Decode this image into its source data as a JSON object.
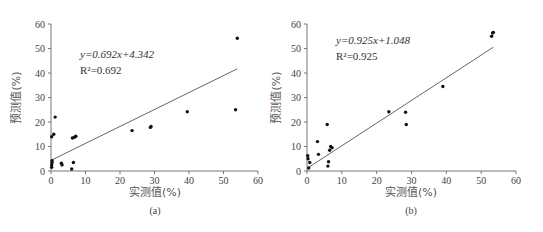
{
  "chart_data": [
    {
      "type": "scatter",
      "panel": "(a)",
      "xlabel": "实测值(%)",
      "ylabel": "预测值(%)",
      "xlim": [
        0,
        60
      ],
      "ylim": [
        0,
        60
      ],
      "xticks": [
        0,
        10,
        20,
        30,
        40,
        50,
        60
      ],
      "yticks": [
        0,
        10,
        20,
        30,
        40,
        50,
        60
      ],
      "grid": false,
      "equation": "y=0.692x+4.342",
      "r2": "R²=0.692",
      "fit": {
        "slope": 0.692,
        "intercept": 4.342,
        "x_range": [
          0,
          54
        ]
      },
      "points": [
        [
          0.2,
          1.5
        ],
        [
          0.2,
          2.5
        ],
        [
          0.3,
          4.2
        ],
        [
          0.3,
          3.5
        ],
        [
          0.2,
          14
        ],
        [
          0.8,
          15
        ],
        [
          1.2,
          22
        ],
        [
          3,
          3.2
        ],
        [
          3.2,
          2.5
        ],
        [
          6,
          0.8
        ],
        [
          6.5,
          3.5
        ],
        [
          6.2,
          13.5
        ],
        [
          6.8,
          13.8
        ],
        [
          7.2,
          14.2
        ],
        [
          23.5,
          16.5
        ],
        [
          28.8,
          17.8
        ],
        [
          29,
          18.2
        ],
        [
          39.5,
          24.2
        ],
        [
          53.5,
          25
        ],
        [
          54,
          54.2
        ]
      ]
    },
    {
      "type": "scatter",
      "panel": "(b)",
      "xlabel": "实测值(%)",
      "ylabel": "预测值(%)",
      "xlim": [
        0,
        60
      ],
      "ylim": [
        0,
        60
      ],
      "xticks": [
        0,
        10,
        20,
        30,
        40,
        50,
        60
      ],
      "yticks": [
        0,
        10,
        20,
        30,
        40,
        50,
        60
      ],
      "grid": false,
      "equation": "y=0.925x+1.048",
      "r2": "R²=0.925",
      "fit": {
        "slope": 0.925,
        "intercept": 1.048,
        "x_range": [
          0,
          53.5
        ]
      },
      "points": [
        [
          0.2,
          6.2
        ],
        [
          0.3,
          5
        ],
        [
          0.5,
          1.2
        ],
        [
          0.8,
          3.5
        ],
        [
          3,
          12
        ],
        [
          3.3,
          6.8
        ],
        [
          5.8,
          19
        ],
        [
          6,
          2
        ],
        [
          6.2,
          3.8
        ],
        [
          6.5,
          8.5
        ],
        [
          6.8,
          10
        ],
        [
          7.2,
          9.5
        ],
        [
          23.5,
          24.2
        ],
        [
          28.3,
          24
        ],
        [
          28.5,
          19
        ],
        [
          39,
          34.5
        ],
        [
          53,
          55
        ],
        [
          53.3,
          56.3
        ],
        [
          53.5,
          56.6
        ]
      ]
    }
  ]
}
